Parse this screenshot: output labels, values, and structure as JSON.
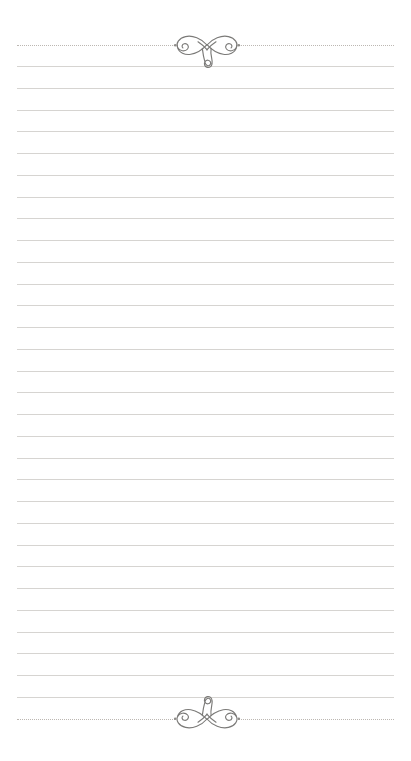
{
  "document": {
    "type": "lined-stationery",
    "title": "Lined Notepaper Sheet",
    "page_width": 411,
    "page_height": 761,
    "background_color": "#ffffff",
    "orientation": "portrait"
  },
  "colors": {
    "page_background": "#ffffff",
    "rule_line": "#d6d4d1",
    "dotted_rule": "#b9b4ae",
    "ornament_stroke": "#7b7a78",
    "ornament_dot": "#8d8b88"
  },
  "layout": {
    "content_left": 17,
    "content_right": 394,
    "content_width": 377
  },
  "header_rule": {
    "name": "top-dotted-border",
    "y": 45,
    "style": "dotted",
    "dot_pitch_px": 4.5,
    "gap_left": 175,
    "gap_right": 238
  },
  "footer_rule": {
    "name": "bottom-dotted-border",
    "y": 719,
    "style": "dotted",
    "dot_pitch_px": 4.5,
    "gap_left": 175,
    "gap_right": 238
  },
  "ornaments": {
    "top": {
      "name": "flourish-ornament-top",
      "description": "calligraphic bow flourish with central teardrop pointing down",
      "center_x": 207,
      "center_y": 45,
      "width": 66,
      "height": 38,
      "flipped": false
    },
    "bottom": {
      "name": "flourish-ornament-bottom",
      "description": "calligraphic bow flourish mirrored vertically, teardrop pointing up",
      "center_x": 207,
      "center_y": 719,
      "width": 66,
      "height": 38,
      "flipped": true
    }
  },
  "rule_lines": {
    "name": "writing-rule-lines",
    "count": 30,
    "first_y": 66,
    "spacing": 21.75,
    "left": 17,
    "right": 394,
    "thickness": 1,
    "y_positions": [
      66,
      88,
      110,
      131,
      153,
      175,
      197,
      218,
      240,
      262,
      284,
      305,
      327,
      349,
      371,
      392,
      414,
      436,
      458,
      479,
      501,
      523,
      545,
      566,
      588,
      610,
      632,
      653,
      675,
      697
    ]
  },
  "writing_area": {
    "name": "writing-area",
    "placeholder": "",
    "value": ""
  }
}
